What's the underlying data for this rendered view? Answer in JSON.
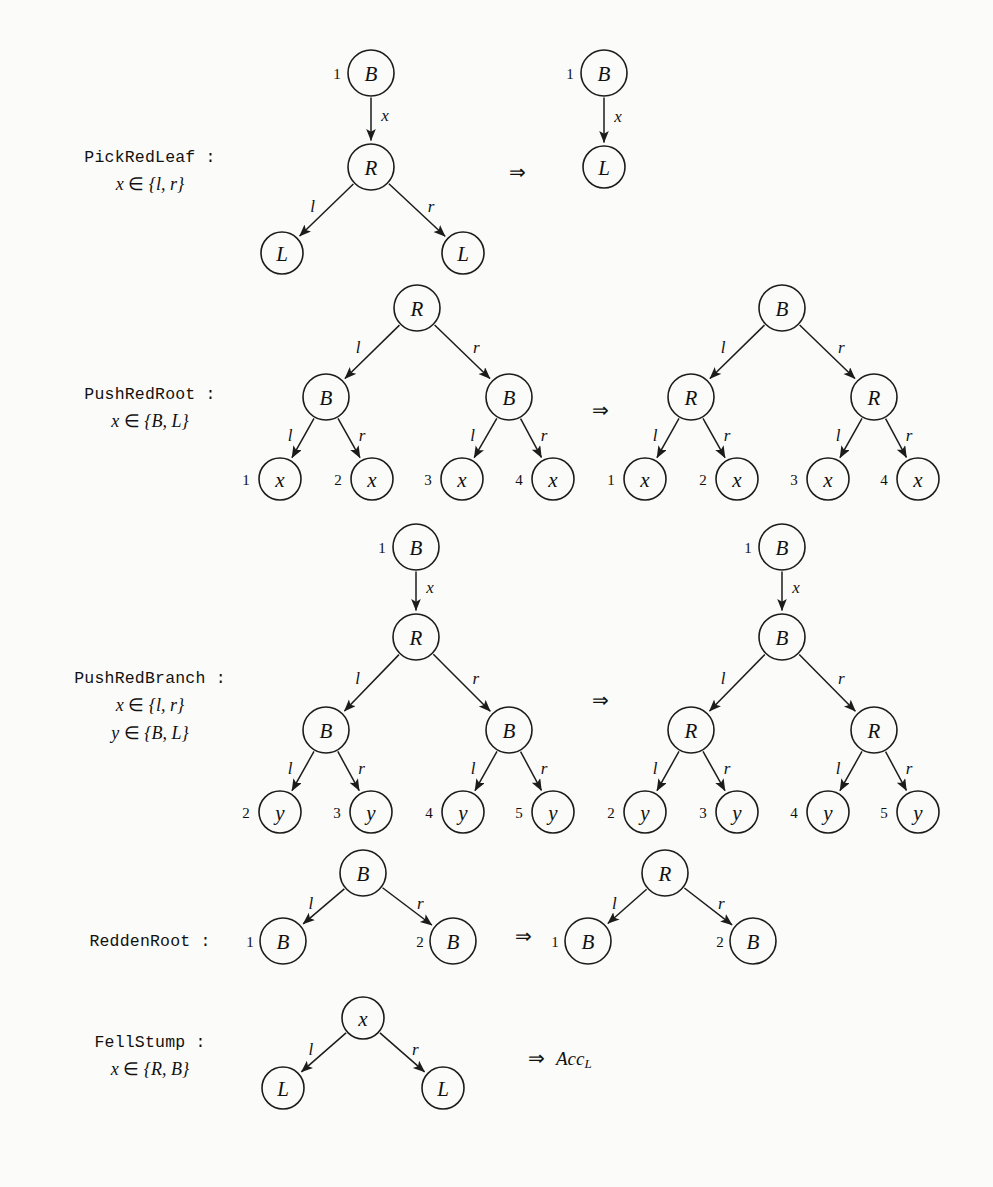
{
  "figure": {
    "implies_glyph": "⇒",
    "node_radius": 23,
    "leaf_radius": 21
  },
  "labels": {
    "B": "B",
    "R": "R",
    "L": "L",
    "x": "x",
    "y": "y",
    "l": "l",
    "r": "r",
    "acc": "Acc",
    "acc_sub": "L"
  },
  "rules": [
    {
      "id": "pick-red-leaf",
      "name": "PickRedLeaf :",
      "conditions": [
        "x ∈ {l, r}"
      ],
      "name_x": 150,
      "name_y": 162,
      "cond_y": [
        190
      ],
      "implies": {
        "x": 517,
        "y": 172
      },
      "lhs": {
        "nodes": [
          {
            "id": "n1",
            "label": "B",
            "cx": 371,
            "cy": 73,
            "port": "1",
            "port_dx": -34,
            "kind": "inner"
          },
          {
            "id": "n2",
            "label": "R",
            "cx": 371,
            "cy": 167,
            "kind": "inner"
          },
          {
            "id": "n3",
            "label": "L",
            "cx": 282,
            "cy": 253,
            "kind": "leaf"
          },
          {
            "id": "n4",
            "label": "L",
            "cx": 463,
            "cy": 253,
            "kind": "leaf"
          }
        ],
        "edges": [
          {
            "from": "n1",
            "to": "n2",
            "label": "x",
            "lab_dx": 14,
            "lab_dy": -4
          },
          {
            "from": "n2",
            "to": "n3",
            "label": "l",
            "lab_dx": -14,
            "lab_dy": -4
          },
          {
            "from": "n2",
            "to": "n4",
            "label": "r",
            "lab_dx": 14,
            "lab_dy": -4
          }
        ]
      },
      "rhs": {
        "nodes": [
          {
            "id": "m1",
            "label": "B",
            "cx": 604,
            "cy": 73,
            "port": "1",
            "port_dx": -34,
            "kind": "inner"
          },
          {
            "id": "m2",
            "label": "L",
            "cx": 604,
            "cy": 167,
            "kind": "leaf"
          }
        ],
        "edges": [
          {
            "from": "m1",
            "to": "m2",
            "label": "x",
            "lab_dx": 14,
            "lab_dy": -4
          }
        ]
      }
    },
    {
      "id": "push-red-root",
      "name": "PushRedRoot :",
      "conditions": [
        "x ∈ {B, L}"
      ],
      "name_x": 150,
      "name_y": 399,
      "cond_y": [
        427
      ],
      "implies": {
        "x": 600,
        "y": 410
      },
      "lhs": {
        "nodes": [
          {
            "id": "a0",
            "label": "R",
            "cx": 417,
            "cy": 308,
            "kind": "inner"
          },
          {
            "id": "a1",
            "label": "B",
            "cx": 326,
            "cy": 397,
            "kind": "inner"
          },
          {
            "id": "a2",
            "label": "B",
            "cx": 509,
            "cy": 397,
            "kind": "inner"
          },
          {
            "id": "a3",
            "label": "x",
            "cx": 280,
            "cy": 479,
            "port": "1",
            "port_dx": -34,
            "kind": "leaf"
          },
          {
            "id": "a4",
            "label": "x",
            "cx": 372,
            "cy": 479,
            "port": "2",
            "port_dx": -34,
            "kind": "leaf"
          },
          {
            "id": "a5",
            "label": "x",
            "cx": 462,
            "cy": 479,
            "port": "3",
            "port_dx": -34,
            "kind": "leaf"
          },
          {
            "id": "a6",
            "label": "x",
            "cx": 553,
            "cy": 479,
            "port": "4",
            "port_dx": -34,
            "kind": "leaf"
          }
        ],
        "edges": [
          {
            "from": "a0",
            "to": "a1",
            "label": "l",
            "lab_dx": -14,
            "lab_dy": -4
          },
          {
            "from": "a0",
            "to": "a2",
            "label": "r",
            "lab_dx": 14,
            "lab_dy": -4
          },
          {
            "from": "a1",
            "to": "a3",
            "label": "l",
            "lab_dx": -13,
            "lab_dy": -3
          },
          {
            "from": "a1",
            "to": "a4",
            "label": "r",
            "lab_dx": 13,
            "lab_dy": -3
          },
          {
            "from": "a2",
            "to": "a5",
            "label": "l",
            "lab_dx": -13,
            "lab_dy": -3
          },
          {
            "from": "a2",
            "to": "a6",
            "label": "r",
            "lab_dx": 13,
            "lab_dy": -3
          }
        ]
      },
      "rhs": {
        "nodes": [
          {
            "id": "b0",
            "label": "B",
            "cx": 782,
            "cy": 308,
            "kind": "inner"
          },
          {
            "id": "b1",
            "label": "R",
            "cx": 691,
            "cy": 397,
            "kind": "inner"
          },
          {
            "id": "b2",
            "label": "R",
            "cx": 874,
            "cy": 397,
            "kind": "inner"
          },
          {
            "id": "b3",
            "label": "x",
            "cx": 645,
            "cy": 479,
            "port": "1",
            "port_dx": -34,
            "kind": "leaf"
          },
          {
            "id": "b4",
            "label": "x",
            "cx": 737,
            "cy": 479,
            "port": "2",
            "port_dx": -34,
            "kind": "leaf"
          },
          {
            "id": "b5",
            "label": "x",
            "cx": 828,
            "cy": 479,
            "port": "3",
            "port_dx": -34,
            "kind": "leaf"
          },
          {
            "id": "b6",
            "label": "x",
            "cx": 918,
            "cy": 479,
            "port": "4",
            "port_dx": -34,
            "kind": "leaf"
          }
        ],
        "edges": [
          {
            "from": "b0",
            "to": "b1",
            "label": "l",
            "lab_dx": -14,
            "lab_dy": -4
          },
          {
            "from": "b0",
            "to": "b2",
            "label": "r",
            "lab_dx": 14,
            "lab_dy": -4
          },
          {
            "from": "b1",
            "to": "b3",
            "label": "l",
            "lab_dx": -13,
            "lab_dy": -3
          },
          {
            "from": "b1",
            "to": "b4",
            "label": "r",
            "lab_dx": 13,
            "lab_dy": -3
          },
          {
            "from": "b2",
            "to": "b5",
            "label": "l",
            "lab_dx": -13,
            "lab_dy": -3
          },
          {
            "from": "b2",
            "to": "b6",
            "label": "r",
            "lab_dx": 13,
            "lab_dy": -3
          }
        ]
      }
    },
    {
      "id": "push-red-branch",
      "name": "PushRedBranch :",
      "conditions": [
        "x ∈ {l, r}",
        "y ∈ {B, L}"
      ],
      "name_x": 150,
      "name_y": 683,
      "cond_y": [
        711,
        739
      ],
      "implies": {
        "x": 600,
        "y": 700
      },
      "lhs": {
        "nodes": [
          {
            "id": "c0",
            "label": "B",
            "cx": 416,
            "cy": 547,
            "port": "1",
            "port_dx": -34,
            "kind": "inner"
          },
          {
            "id": "c1",
            "label": "R",
            "cx": 416,
            "cy": 637,
            "kind": "inner"
          },
          {
            "id": "c2",
            "label": "B",
            "cx": 326,
            "cy": 730,
            "kind": "inner"
          },
          {
            "id": "c3",
            "label": "B",
            "cx": 509,
            "cy": 730,
            "kind": "inner"
          },
          {
            "id": "c4",
            "label": "y",
            "cx": 280,
            "cy": 812,
            "port": "2",
            "port_dx": -34,
            "kind": "leaf"
          },
          {
            "id": "c5",
            "label": "y",
            "cx": 371,
            "cy": 812,
            "port": "3",
            "port_dx": -34,
            "kind": "leaf"
          },
          {
            "id": "c6",
            "label": "y",
            "cx": 463,
            "cy": 812,
            "port": "4",
            "port_dx": -34,
            "kind": "leaf"
          },
          {
            "id": "c7",
            "label": "y",
            "cx": 553,
            "cy": 812,
            "port": "5",
            "port_dx": -34,
            "kind": "leaf"
          }
        ],
        "edges": [
          {
            "from": "c0",
            "to": "c1",
            "label": "x",
            "lab_dx": 14,
            "lab_dy": -4
          },
          {
            "from": "c1",
            "to": "c2",
            "label": "l",
            "lab_dx": -14,
            "lab_dy": -4
          },
          {
            "from": "c1",
            "to": "c3",
            "label": "r",
            "lab_dx": 14,
            "lab_dy": -4
          },
          {
            "from": "c2",
            "to": "c4",
            "label": "l",
            "lab_dx": -13,
            "lab_dy": -3
          },
          {
            "from": "c2",
            "to": "c5",
            "label": "r",
            "lab_dx": 13,
            "lab_dy": -3
          },
          {
            "from": "c3",
            "to": "c6",
            "label": "l",
            "lab_dx": -13,
            "lab_dy": -3
          },
          {
            "from": "c3",
            "to": "c7",
            "label": "r",
            "lab_dx": 13,
            "lab_dy": -3
          }
        ]
      },
      "rhs": {
        "nodes": [
          {
            "id": "d0",
            "label": "B",
            "cx": 782,
            "cy": 547,
            "port": "1",
            "port_dx": -34,
            "kind": "inner"
          },
          {
            "id": "d1",
            "label": "B",
            "cx": 782,
            "cy": 637,
            "kind": "inner"
          },
          {
            "id": "d2",
            "label": "R",
            "cx": 691,
            "cy": 730,
            "kind": "inner"
          },
          {
            "id": "d3",
            "label": "R",
            "cx": 874,
            "cy": 730,
            "kind": "inner"
          },
          {
            "id": "d4",
            "label": "y",
            "cx": 645,
            "cy": 812,
            "port": "2",
            "port_dx": -34,
            "kind": "leaf"
          },
          {
            "id": "d5",
            "label": "y",
            "cx": 737,
            "cy": 812,
            "port": "3",
            "port_dx": -34,
            "kind": "leaf"
          },
          {
            "id": "d6",
            "label": "y",
            "cx": 828,
            "cy": 812,
            "port": "4",
            "port_dx": -34,
            "kind": "leaf"
          },
          {
            "id": "d7",
            "label": "y",
            "cx": 918,
            "cy": 812,
            "port": "5",
            "port_dx": -34,
            "kind": "leaf"
          }
        ],
        "edges": [
          {
            "from": "d0",
            "to": "d1",
            "label": "x",
            "lab_dx": 14,
            "lab_dy": -4
          },
          {
            "from": "d1",
            "to": "d2",
            "label": "l",
            "lab_dx": -14,
            "lab_dy": -4
          },
          {
            "from": "d1",
            "to": "d3",
            "label": "r",
            "lab_dx": 14,
            "lab_dy": -4
          },
          {
            "from": "d2",
            "to": "d4",
            "label": "l",
            "lab_dx": -13,
            "lab_dy": -3
          },
          {
            "from": "d2",
            "to": "d5",
            "label": "r",
            "lab_dx": 13,
            "lab_dy": -3
          },
          {
            "from": "d3",
            "to": "d6",
            "label": "l",
            "lab_dx": -13,
            "lab_dy": -3
          },
          {
            "from": "d3",
            "to": "d7",
            "label": "r",
            "lab_dx": 13,
            "lab_dy": -3
          }
        ]
      }
    },
    {
      "id": "redden-root",
      "name": "ReddenRoot :",
      "conditions": [],
      "name_x": 150,
      "name_y": 946,
      "cond_y": [],
      "implies": {
        "x": 523,
        "y": 936
      },
      "lhs": {
        "nodes": [
          {
            "id": "e0",
            "label": "B",
            "cx": 363,
            "cy": 873,
            "kind": "inner"
          },
          {
            "id": "e1",
            "label": "B",
            "cx": 283,
            "cy": 941,
            "port": "1",
            "port_dx": -33,
            "kind": "inner"
          },
          {
            "id": "e2",
            "label": "B",
            "cx": 453,
            "cy": 941,
            "port": "2",
            "port_dx": -33,
            "kind": "inner"
          }
        ],
        "edges": [
          {
            "from": "e0",
            "to": "e1",
            "label": "l",
            "lab_dx": -13,
            "lab_dy": -3
          },
          {
            "from": "e0",
            "to": "e2",
            "label": "r",
            "lab_dx": 13,
            "lab_dy": -3
          }
        ]
      },
      "rhs": {
        "nodes": [
          {
            "id": "f0",
            "label": "R",
            "cx": 665,
            "cy": 873,
            "kind": "inner"
          },
          {
            "id": "f1",
            "label": "B",
            "cx": 588,
            "cy": 941,
            "port": "1",
            "port_dx": -33,
            "kind": "inner"
          },
          {
            "id": "f2",
            "label": "B",
            "cx": 753,
            "cy": 941,
            "port": "2",
            "port_dx": -33,
            "kind": "inner"
          }
        ],
        "edges": [
          {
            "from": "f0",
            "to": "f1",
            "label": "l",
            "lab_dx": -13,
            "lab_dy": -3
          },
          {
            "from": "f0",
            "to": "f2",
            "label": "r",
            "lab_dx": 13,
            "lab_dy": -3
          }
        ]
      }
    },
    {
      "id": "fell-stump",
      "name": "FellStump :",
      "conditions": [
        "x ∈ {R, B}"
      ],
      "name_x": 150,
      "name_y": 1047,
      "cond_y": [
        1075
      ],
      "implies": {
        "x": 536,
        "y": 1058
      },
      "lhs": {
        "nodes": [
          {
            "id": "g0",
            "label": "x",
            "cx": 363,
            "cy": 1018,
            "kind": "leaf"
          },
          {
            "id": "g1",
            "label": "L",
            "cx": 283,
            "cy": 1088,
            "kind": "leaf"
          },
          {
            "id": "g2",
            "label": "L",
            "cx": 443,
            "cy": 1088,
            "kind": "leaf"
          }
        ],
        "edges": [
          {
            "from": "g0",
            "to": "g1",
            "label": "l",
            "lab_dx": -13,
            "lab_dy": -3
          },
          {
            "from": "g0",
            "to": "g2",
            "label": "r",
            "lab_dx": 13,
            "lab_dy": -3
          }
        ]
      },
      "rhs": {
        "nodes": [],
        "edges": [],
        "accept": {
          "x": 556,
          "y": 1058,
          "text": "Acc",
          "sub": "L"
        }
      }
    }
  ]
}
